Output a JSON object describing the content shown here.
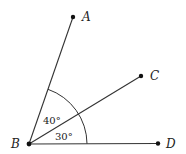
{
  "diagram": {
    "colors": {
      "stroke": "#333333",
      "text": "#222222",
      "background": "#ffffff"
    },
    "points": {
      "A": {
        "label": "A",
        "x": 73,
        "y": 17
      },
      "B": {
        "label": "B",
        "x": 29,
        "y": 144
      },
      "C": {
        "label": "C",
        "x": 141,
        "y": 76
      },
      "D": {
        "label": "D",
        "x": 158,
        "y": 143
      }
    },
    "rays": [
      "BA",
      "BC",
      "BD"
    ],
    "angles": {
      "ABC": {
        "label": "40°",
        "value": 40
      },
      "CBD": {
        "label": "30°",
        "value": 30
      }
    }
  }
}
